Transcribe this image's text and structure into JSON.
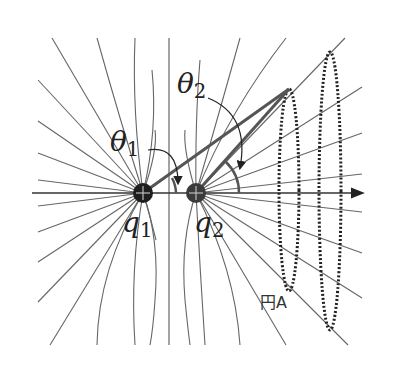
{
  "diagram": {
    "type": "electric-field-lines",
    "labels": {
      "theta1_main": "θ",
      "theta1_sub": "1",
      "theta2_main": "θ",
      "theta2_sub": "2",
      "q1_main": "q",
      "q1_sub": "1",
      "q2_main": "q",
      "q2_sub": "2",
      "circle_a": "円A"
    },
    "charges": [
      {
        "name": "q1",
        "x": 143,
        "y": 193,
        "sign": "+"
      },
      {
        "name": "q2",
        "x": 196,
        "y": 193,
        "sign": "+"
      }
    ],
    "point": {
      "x": 289,
      "y": 89
    },
    "axes": {
      "horizontal": {
        "y": 193,
        "x1": 32,
        "x2": 365,
        "arrow": true
      },
      "vertical": {
        "x": 169,
        "y1": 38,
        "y2": 345
      }
    },
    "circles": [
      {
        "name": "円A",
        "cx": 289,
        "cy": 190,
        "rx": 10,
        "ry": 101
      },
      {
        "name": "outer",
        "cx": 330,
        "cy": 191,
        "rx": 11,
        "ry": 139
      }
    ],
    "colors": {
      "lines": "#555555",
      "charge_q1": "#1e1e1e",
      "charge_q2": "#3a3a3a",
      "thick_lines": "#555555"
    }
  }
}
